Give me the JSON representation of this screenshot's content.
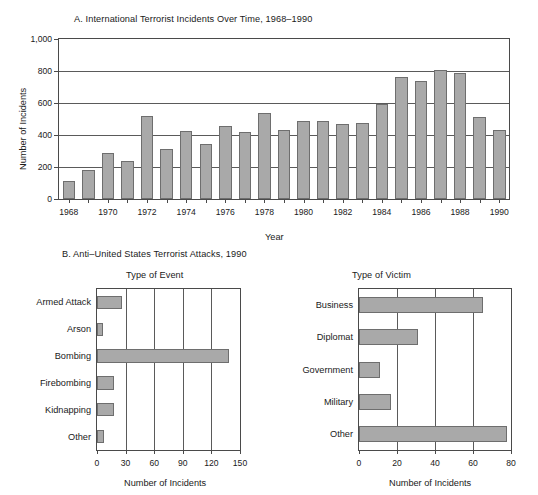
{
  "panel_a": {
    "title": "A.  International Terrorist Incidents Over Time, 1968–1990",
    "ylabel": "Number of Incidents",
    "xlabel": "Year"
  },
  "panel_b": {
    "title": "B.  Anti–United States Terrorist Attacks, 1990",
    "left_subtitle": "Type of Event",
    "right_subtitle": "Type of Victim",
    "left_xlabel": "Number of Incidents",
    "right_xlabel": "Number of Incidents"
  },
  "colors": {
    "bar_fill": "#a9a9a9",
    "bar_stroke": "#6e6e6e",
    "axis": "#4a4a4a",
    "grid": "#5a5a5a",
    "text": "#1a1a1a",
    "background": "#ffffff"
  },
  "chart_data": [
    {
      "id": "panel-a",
      "type": "bar",
      "orientation": "vertical",
      "title": "A.  International Terrorist Incidents Over Time, 1968–1990",
      "xlabel": "Year",
      "ylabel": "Number of Incidents",
      "ylim": [
        0,
        1000
      ],
      "yticks": [
        0,
        200,
        400,
        600,
        800,
        1000
      ],
      "ytick_labels": [
        "0",
        "200",
        "400",
        "600",
        "800",
        "1,000"
      ],
      "grid": "horizontal",
      "legend": "none",
      "categories": [
        1968,
        1969,
        1970,
        1971,
        1972,
        1973,
        1974,
        1975,
        1976,
        1977,
        1978,
        1979,
        1980,
        1981,
        1982,
        1983,
        1984,
        1985,
        1986,
        1987,
        1988,
        1989,
        1990
      ],
      "xtick_labels": [
        "1968",
        "1970",
        "1972",
        "1974",
        "1976",
        "1978",
        "1980",
        "1982",
        "1984",
        "1986",
        "1988",
        "1990"
      ],
      "values": [
        115,
        180,
        290,
        235,
        520,
        315,
        425,
        345,
        455,
        420,
        535,
        430,
        485,
        490,
        470,
        475,
        595,
        765,
        740,
        805,
        790,
        510,
        430
      ]
    },
    {
      "id": "panel-b-event",
      "type": "bar",
      "orientation": "horizontal",
      "title": "Type of Event",
      "xlabel": "Number of Incidents",
      "ylabel": "",
      "xlim": [
        0,
        150
      ],
      "xticks": [
        0,
        30,
        60,
        90,
        120,
        150
      ],
      "xtick_labels": [
        "0",
        "30",
        "60",
        "90",
        "120",
        "150"
      ],
      "grid": "vertical",
      "legend": "none",
      "categories": [
        "Armed Attack",
        "Arson",
        "Bombing",
        "Firebombing",
        "Kidnapping",
        "Other"
      ],
      "values": [
        26,
        6,
        138,
        18,
        18,
        7
      ]
    },
    {
      "id": "panel-b-victim",
      "type": "bar",
      "orientation": "horizontal",
      "title": "Type of Victim",
      "xlabel": "Number of Incidents",
      "ylabel": "",
      "xlim": [
        0,
        80
      ],
      "xticks": [
        0,
        20,
        40,
        60,
        80
      ],
      "xtick_labels": [
        "0",
        "20",
        "40",
        "60",
        "80"
      ],
      "grid": "vertical",
      "legend": "none",
      "categories": [
        "Business",
        "Diplomat",
        "Government",
        "Military",
        "Other"
      ],
      "values": [
        65,
        31,
        11,
        17,
        78
      ]
    }
  ]
}
